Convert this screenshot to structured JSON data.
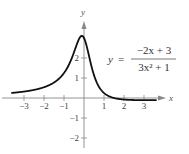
{
  "chart_data": {
    "type": "line",
    "title": "",
    "equation": {
      "lhs": "y",
      "equals": "=",
      "numerator": "−2x + 3",
      "denominator": "3x² + 1"
    },
    "xlabel": "x",
    "ylabel": "y",
    "xlim": [
      -3.6,
      3.6
    ],
    "ylim": [
      -2.5,
      3.8
    ],
    "x_ticks": [
      -3,
      -2,
      -1,
      1,
      2,
      3
    ],
    "x_tick_labels": [
      "−3",
      "−2",
      "−1",
      "1",
      "2",
      "3"
    ],
    "y_ticks": [
      -2,
      -1,
      1,
      2
    ],
    "y_tick_labels": [
      "−2",
      "−1",
      "1",
      "2"
    ],
    "grid": false,
    "series": [
      {
        "name": "y = (-2x + 3)/(3x^2 + 1)",
        "x": [
          -3.5,
          -3,
          -2.5,
          -2,
          -1.5,
          -1,
          -0.75,
          -0.5,
          -0.3,
          -0.18,
          0,
          0.25,
          0.5,
          0.75,
          1,
          1.5,
          2,
          2.5,
          3,
          3.5
        ],
        "y": [
          0.27,
          0.32,
          0.41,
          0.54,
          0.8,
          1.25,
          1.6,
          2.29,
          2.83,
          3.09,
          3.0,
          2.16,
          1.14,
          0.55,
          0.25,
          0.0,
          -0.08,
          -0.1,
          -0.11,
          -0.11
        ]
      }
    ],
    "curve_color": "#111111",
    "axis_color": "#888888"
  }
}
